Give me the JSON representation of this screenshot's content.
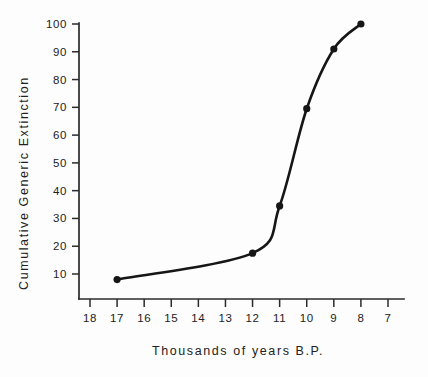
{
  "chart_data": {
    "type": "line",
    "title": "",
    "subtitle": "",
    "xlabel": "Thousands of years B.P.",
    "ylabel": "Cumulative Generic Extinction",
    "x": [
      17,
      12,
      11,
      10,
      9,
      8
    ],
    "values": [
      8,
      17.5,
      34.5,
      69.5,
      91,
      100
    ],
    "series": [
      {
        "name": "Cumulative Generic Extinction",
        "x": [
          17,
          12,
          11,
          10,
          9,
          8
        ],
        "values": [
          8,
          17.5,
          34.5,
          69.5,
          91,
          100
        ]
      }
    ],
    "xticks": [
      18,
      17,
      16,
      15,
      14,
      13,
      12,
      11,
      10,
      9,
      8,
      7
    ],
    "xtick_labels": [
      "18",
      "17",
      "16",
      "15",
      "14",
      "13",
      "12",
      "11",
      "10",
      "9",
      "8",
      "7"
    ],
    "yticks": [
      10,
      20,
      30,
      40,
      50,
      60,
      70,
      80,
      90,
      100
    ],
    "ytick_labels": [
      "10",
      "20",
      "30",
      "40",
      "50",
      "60",
      "70",
      "80",
      "90",
      "100"
    ],
    "xlim": [
      18.5,
      6.5
    ],
    "ylim": [
      0,
      100
    ],
    "x_axis_inverted": true,
    "grid": false,
    "legend": false,
    "legend_position": "none",
    "line_color": "#161616",
    "marker_color": "#161616",
    "marker_style": "circle",
    "axis_color": "#2b2b2b",
    "background_color": "#fdfdfd"
  },
  "axes": {
    "y_label_text": "Cumulative Generic Extinction",
    "x_label_text": "Thousands of years B.P."
  }
}
